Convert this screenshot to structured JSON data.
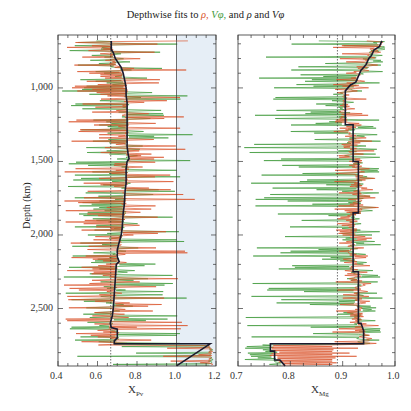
{
  "title": {
    "prefix": "Depthwise fits to ",
    "rho": "ρ,",
    "vphi": "Vφ,",
    "middle": " and ",
    "rho2": "ρ",
    "and": " and ",
    "vphi2": "Vφ"
  },
  "colors": {
    "rho_fit": "#d9542b",
    "vphi_fit": "#3f9a3a",
    "joint_fit": "#1a1a2e",
    "shade": "#e6eef6",
    "reference_line": "#333333"
  },
  "chart_data": [
    {
      "type": "line",
      "panel": "left",
      "title": "Depthwise fits to ρ, Vφ, and ρ and Vφ",
      "xlabel": "X_Pv",
      "xlabel_main": "X",
      "xlabel_sub": "Pv",
      "ylabel": "Depth (km)",
      "xlim": [
        0.4,
        1.2
      ],
      "ylim": [
        640,
        2891
      ],
      "y_inverted": true,
      "x_ticks": [
        "0.4",
        "0.6",
        "0.8",
        "1.0",
        "1.2"
      ],
      "y_ticks": [
        "1,000",
        "1,500",
        "2,000",
        "2,500"
      ],
      "reference_lines": [
        {
          "x": 0.667,
          "style": "dotted"
        },
        {
          "x": 1.0,
          "style": "solid"
        }
      ],
      "shaded_region": {
        "x_from": 1.0,
        "x_to": 1.2
      },
      "series": [
        {
          "name": "fit to ρ",
          "color": "red",
          "style": "noisy spikes",
          "range": [
            0.42,
            1.2
          ]
        },
        {
          "name": "fit to Vφ",
          "color": "green",
          "style": "noisy spikes",
          "range": [
            0.42,
            1.2
          ]
        },
        {
          "name": "fit to ρ and Vφ",
          "color": "black",
          "points": [
            [
              0.67,
              680
            ],
            [
              0.67,
              740
            ],
            [
              0.68,
              760
            ],
            [
              0.69,
              800
            ],
            [
              0.72,
              860
            ],
            [
              0.73,
              900
            ],
            [
              0.74,
              960
            ],
            [
              0.745,
              1000
            ],
            [
              0.745,
              1050
            ],
            [
              0.75,
              1100
            ],
            [
              0.75,
              1200
            ],
            [
              0.75,
              1300
            ],
            [
              0.75,
              1400
            ],
            [
              0.755,
              1450
            ],
            [
              0.76,
              1480
            ],
            [
              0.75,
              1500
            ],
            [
              0.745,
              1550
            ],
            [
              0.745,
              1650
            ],
            [
              0.74,
              1700
            ],
            [
              0.735,
              1800
            ],
            [
              0.73,
              1850
            ],
            [
              0.725,
              1950
            ],
            [
              0.72,
              2000
            ],
            [
              0.71,
              2050
            ],
            [
              0.7,
              2100
            ],
            [
              0.7,
              2150
            ],
            [
              0.71,
              2180
            ],
            [
              0.695,
              2200
            ],
            [
              0.69,
              2300
            ],
            [
              0.685,
              2400
            ],
            [
              0.68,
              2500
            ],
            [
              0.675,
              2550
            ],
            [
              0.665,
              2600
            ],
            [
              0.67,
              2630
            ],
            [
              0.7,
              2640
            ],
            [
              0.7,
              2700
            ],
            [
              0.685,
              2720
            ],
            [
              0.685,
              2740
            ],
            [
              1.17,
              2740
            ],
            [
              1.0,
              2890
            ]
          ]
        }
      ]
    },
    {
      "type": "line",
      "panel": "right",
      "xlabel": "X_Mg",
      "xlabel_main": "X",
      "xlabel_sub": "Mg",
      "xlim": [
        0.7,
        1.0
      ],
      "ylim": [
        640,
        2891
      ],
      "y_inverted": true,
      "x_ticks": [
        "0.7",
        "0.8",
        "0.9",
        "1.0"
      ],
      "reference_lines": [
        {
          "x": 0.89,
          "style": "dotted"
        }
      ],
      "series": [
        {
          "name": "fit to ρ",
          "color": "red",
          "style": "noisy spikes",
          "range": [
            0.88,
            0.98
          ]
        },
        {
          "name": "fit to Vφ",
          "color": "green",
          "style": "noisy spikes",
          "range": [
            0.71,
            0.99
          ]
        },
        {
          "name": "fit to ρ and Vφ",
          "color": "black",
          "points": [
            [
              0.975,
              680
            ],
            [
              0.97,
              720
            ],
            [
              0.96,
              740
            ],
            [
              0.955,
              780
            ],
            [
              0.95,
              800
            ],
            [
              0.945,
              840
            ],
            [
              0.94,
              860
            ],
            [
              0.935,
              880
            ],
            [
              0.93,
              920
            ],
            [
              0.925,
              960
            ],
            [
              0.915,
              980
            ],
            [
              0.91,
              1000
            ],
            [
              0.905,
              1020
            ],
            [
              0.905,
              1250
            ],
            [
              0.92,
              1250
            ],
            [
              0.92,
              1500
            ],
            [
              0.93,
              1500
            ],
            [
              0.93,
              1850
            ],
            [
              0.92,
              1850
            ],
            [
              0.92,
              2250
            ],
            [
              0.93,
              2250
            ],
            [
              0.93,
              2600
            ],
            [
              0.935,
              2600
            ],
            [
              0.94,
              2650
            ],
            [
              0.94,
              2740
            ],
            [
              0.762,
              2740
            ],
            [
              0.762,
              2790
            ],
            [
              0.77,
              2790
            ],
            [
              0.77,
              2850
            ],
            [
              0.78,
              2850
            ],
            [
              0.79,
              2890
            ]
          ]
        }
      ]
    }
  ],
  "axes": {
    "left": {
      "xticks": [
        {
          "v": 0.4,
          "label": "0.4"
        },
        {
          "v": 0.6,
          "label": "0.6"
        },
        {
          "v": 0.8,
          "label": "0.8"
        },
        {
          "v": 1.0,
          "label": "1.0"
        },
        {
          "v": 1.2,
          "label": "1.2"
        }
      ],
      "xlabel_main": "X",
      "xlabel_sub": "Pv"
    },
    "right": {
      "xticks": [
        {
          "v": 0.7,
          "label": "0.7"
        },
        {
          "v": 0.8,
          "label": "0.8"
        },
        {
          "v": 0.9,
          "label": "0.9"
        },
        {
          "v": 1.0,
          "label": "1.0"
        }
      ],
      "xlabel_main": "X",
      "xlabel_sub": "Mg"
    },
    "yticks": [
      {
        "v": 1000,
        "label": "1,000"
      },
      {
        "v": 1500,
        "label": "1,500"
      },
      {
        "v": 2000,
        "label": "2,000"
      },
      {
        "v": 2500,
        "label": "2,500"
      }
    ],
    "ylabel": "Depth (km)"
  }
}
